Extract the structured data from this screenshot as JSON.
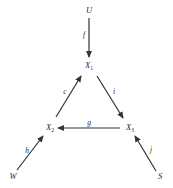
{
  "diagram": {
    "stroke_color": "#333333",
    "background": "#ffffff",
    "nodes": {
      "U": {
        "label": "U",
        "sub": ""
      },
      "X1": {
        "label": "X",
        "sub": "1"
      },
      "X2": {
        "label": "X",
        "sub": "2"
      },
      "X3": {
        "label": "X",
        "sub": "3"
      },
      "W": {
        "label": "W",
        "sub": ""
      },
      "S": {
        "label": "S",
        "sub": ""
      }
    },
    "edges": [
      {
        "id": "f",
        "label": "f",
        "from": "U",
        "to": "X1"
      },
      {
        "id": "c",
        "label": "c",
        "from": "X2",
        "to": "X1"
      },
      {
        "id": "i",
        "label": "i",
        "from": "X1",
        "to": "X3"
      },
      {
        "id": "g",
        "label": "g",
        "from": "X3",
        "to": "X2"
      },
      {
        "id": "h",
        "label": "h",
        "from": "W",
        "to": "X2"
      },
      {
        "id": "j",
        "label": "j",
        "from": "S",
        "to": "X3"
      }
    ]
  }
}
